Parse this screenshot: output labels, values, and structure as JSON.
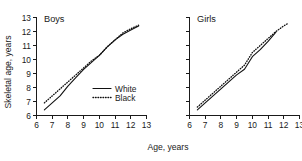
{
  "chart_data": {
    "type": "line",
    "title": "",
    "xlabel": "Age, years",
    "ylabel": "Skeletal age, years",
    "xlim": [
      6,
      13
    ],
    "ylim": [
      6,
      13
    ],
    "xticks": [
      6,
      7,
      8,
      9,
      10,
      11,
      12,
      13
    ],
    "yticks": [
      6,
      7,
      8,
      9,
      10,
      11,
      12,
      13
    ],
    "xtick_labels": [
      "6",
      "7",
      "8",
      "9",
      "10",
      "11",
      "12",
      "13"
    ],
    "ytick_labels": [
      "6",
      "7",
      "8",
      "9",
      "10",
      "11",
      "12",
      "13"
    ],
    "grid": false,
    "legend_position": "lower-right-of-first-panel",
    "panels": [
      {
        "label": "Boys",
        "series": [
          {
            "name": "White",
            "style": "solid",
            "color": "#111111",
            "x": [
              6.5,
              7.0,
              7.5,
              8.0,
              8.5,
              9.0,
              9.5,
              10.0,
              10.5,
              11.0,
              11.5,
              12.0,
              12.5
            ],
            "y": [
              6.4,
              6.9,
              7.4,
              8.1,
              8.7,
              9.3,
              9.8,
              10.3,
              10.9,
              11.4,
              11.8,
              12.1,
              12.4
            ]
          },
          {
            "name": "Black",
            "style": "dotted",
            "color": "#111111",
            "x": [
              6.5,
              7.0,
              7.5,
              8.0,
              8.5,
              9.0,
              9.5,
              10.0,
              10.5,
              11.0,
              11.5,
              12.0,
              12.5
            ],
            "y": [
              6.9,
              7.4,
              7.9,
              8.4,
              8.9,
              9.4,
              9.9,
              10.3,
              10.9,
              11.4,
              11.9,
              12.2,
              12.45
            ]
          }
        ]
      },
      {
        "label": "Girls",
        "series": [
          {
            "name": "White",
            "style": "solid",
            "color": "#111111",
            "x": [
              6.5,
              7.0,
              7.5,
              8.0,
              8.5,
              9.0,
              9.5,
              10.0,
              10.5,
              11.0,
              11.5
            ],
            "y": [
              6.4,
              6.9,
              7.4,
              7.9,
              8.4,
              8.9,
              9.3,
              10.2,
              10.7,
              11.3,
              11.95
            ]
          },
          {
            "name": "Black",
            "style": "dotted",
            "color": "#111111",
            "x": [
              6.5,
              7.0,
              7.5,
              8.0,
              8.5,
              9.0,
              9.5,
              10.0,
              10.5,
              11.0,
              11.5,
              12.0,
              12.3
            ],
            "y": [
              6.6,
              7.1,
              7.6,
              8.1,
              8.6,
              9.1,
              9.6,
              10.5,
              11.0,
              11.5,
              12.0,
              12.4,
              12.6
            ]
          }
        ]
      }
    ],
    "legend": [
      {
        "label": "White",
        "style": "solid"
      },
      {
        "label": "Black",
        "style": "dotted"
      }
    ]
  }
}
